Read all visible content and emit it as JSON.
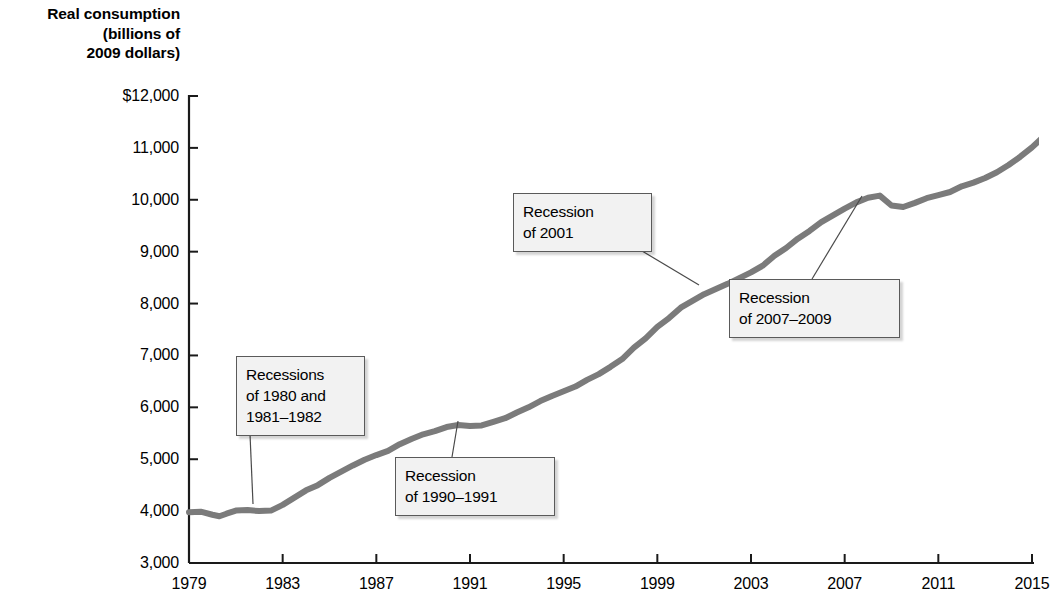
{
  "chart_data": {
    "type": "line",
    "title": "",
    "ylabel": "Real consumption\n(billions of\n2009 dollars)",
    "xlabel": "",
    "xlim": [
      1979,
      2015
    ],
    "ylim": [
      3000,
      12000
    ],
    "grid": false,
    "legend_position": "none",
    "line_color": "#7b7b7b",
    "xticks": [
      "1979",
      "1983",
      "1987",
      "1991",
      "1995",
      "1999",
      "2003",
      "2007",
      "2011",
      "2015"
    ],
    "yticks": [
      "$12,000",
      "11,000",
      "10,000",
      "9,000",
      "8,000",
      "7,000",
      "6,000",
      "5,000",
      "4,000",
      "3,000"
    ],
    "series": [
      {
        "name": "Real consumption",
        "x": [
          1979.0,
          1979.5,
          1980.0,
          1980.3,
          1980.6,
          1981.0,
          1981.5,
          1982.0,
          1982.5,
          1983.0,
          1983.5,
          1984.0,
          1984.5,
          1985.0,
          1985.5,
          1986.0,
          1986.5,
          1987.0,
          1987.5,
          1988.0,
          1988.5,
          1989.0,
          1989.5,
          1990.0,
          1990.5,
          1991.0,
          1991.5,
          1992.0,
          1992.5,
          1993.0,
          1993.5,
          1994.0,
          1994.5,
          1995.0,
          1995.5,
          1996.0,
          1996.5,
          1997.0,
          1997.5,
          1998.0,
          1998.5,
          1999.0,
          1999.5,
          2000.0,
          2000.5,
          2001.0,
          2001.5,
          2002.0,
          2002.5,
          2003.0,
          2003.5,
          2004.0,
          2004.5,
          2005.0,
          2005.5,
          2006.0,
          2006.5,
          2007.0,
          2007.5,
          2008.0,
          2008.5,
          2009.0,
          2009.5,
          2010.0,
          2010.5,
          2011.0,
          2011.5,
          2012.0,
          2012.5,
          2013.0,
          2013.5,
          2014.0,
          2014.5,
          2015.0,
          2015.4
        ],
        "y": [
          3980,
          3990,
          3930,
          3900,
          3950,
          4010,
          4020,
          4000,
          4010,
          4120,
          4260,
          4400,
          4500,
          4640,
          4760,
          4880,
          4990,
          5080,
          5160,
          5290,
          5390,
          5480,
          5540,
          5620,
          5660,
          5640,
          5650,
          5720,
          5790,
          5900,
          6000,
          6120,
          6220,
          6310,
          6400,
          6530,
          6640,
          6780,
          6930,
          7150,
          7330,
          7550,
          7720,
          7920,
          8050,
          8180,
          8280,
          8380,
          8490,
          8600,
          8730,
          8920,
          9070,
          9250,
          9400,
          9570,
          9700,
          9830,
          9950,
          10040,
          10080,
          9890,
          9860,
          9940,
          10030,
          10090,
          10150,
          10260,
          10330,
          10420,
          10530,
          10670,
          10830,
          11010,
          11180
        ]
      }
    ],
    "annotations": [
      {
        "id": "recessions-1980-1982",
        "text": "Recessions\nof 1980 and\n1981–1982",
        "box_left": 236,
        "box_top": 356,
        "box_width": 109,
        "leader_from_x": 250,
        "leader_from_y": 434,
        "leader_to_x": 253,
        "leader_to_y": 504
      },
      {
        "id": "recession-1990-1991",
        "text": "Recession\nof 1990–1991",
        "box_left": 395,
        "box_top": 457,
        "box_width": 140,
        "leader_from_x": 452,
        "leader_from_y": 457,
        "leader_to_x": 458,
        "leader_to_y": 421
      },
      {
        "id": "recession-2001",
        "text": "Recession\nof 2001",
        "box_left": 513,
        "box_top": 193,
        "box_width": 119,
        "leader_from_x": 632,
        "leader_from_y": 245,
        "leader_to_x": 699,
        "leader_to_y": 285
      },
      {
        "id": "recession-2007-2009",
        "text": "Recession\nof 2007–2009",
        "box_left": 729,
        "box_top": 279,
        "box_width": 151,
        "leader_from_x": 812,
        "leader_from_y": 279,
        "leader_to_x": 862,
        "leader_to_y": 196
      }
    ]
  },
  "axis_geometry": {
    "plot_left": 189,
    "plot_right": 1032,
    "plot_top": 96,
    "plot_bottom": 563
  }
}
